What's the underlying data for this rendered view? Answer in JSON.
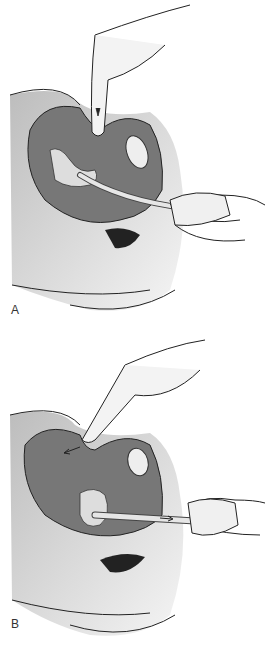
{
  "figure": {
    "panels": [
      {
        "label": "A",
        "description": "Finger pressing downward on abdomen while uterine manipulator inserted through vagina"
      },
      {
        "label": "B",
        "description": "Finger pressing on abdomen toward fundus while manipulator withdrawn outward"
      }
    ],
    "colors": {
      "tissue_dark": "#6e6e6e",
      "tissue_mid": "#9a9a9a",
      "tissue_light": "#c8c8c8",
      "skin": "#f2f2f2",
      "outline": "#222222"
    }
  }
}
